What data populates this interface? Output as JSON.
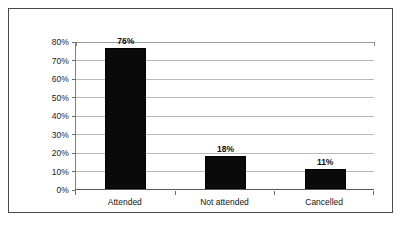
{
  "chart_data": {
    "type": "bar",
    "title": "",
    "subtitle": "",
    "xlabel": "",
    "ylabel": "",
    "categories": [
      "Attended",
      "Not attended",
      "Cancelled"
    ],
    "values": [
      76,
      18,
      11
    ],
    "value_labels": [
      "76%",
      "18%",
      "11%"
    ],
    "ylim": [
      0,
      80
    ],
    "ytick_values": [
      0,
      10,
      20,
      30,
      40,
      50,
      60,
      70,
      80
    ],
    "ytick_labels": [
      "0%",
      "10%",
      "20%",
      "30%",
      "40%",
      "50%",
      "60%",
      "70%",
      "80%"
    ],
    "grid": true,
    "legend": false,
    "legend_position": "none",
    "bar_color": "#0a0a0a",
    "gridline_color": "#b9b9b9",
    "axis_color": "#595959",
    "background_color": "#ffffff",
    "border_color": "#4a4a4a"
  }
}
